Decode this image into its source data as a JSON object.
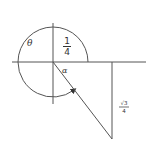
{
  "diagram": {
    "type": "angle-rotation-diagram",
    "colors": {
      "stroke": "#555555",
      "text": "#333333",
      "background": "#ffffff"
    },
    "labels": {
      "theta": "θ",
      "alpha": "α",
      "quarter_num": "1",
      "quarter_den": "4",
      "sqrt3_num": "√3",
      "sqrt3_den": "4"
    },
    "geometry": {
      "origin": [
        53,
        62
      ],
      "arc_radius": 35,
      "x_axis": [
        12,
        146
      ],
      "y_axis": [
        23,
        104
      ],
      "terminal_point": [
        112,
        139
      ],
      "foot_point": [
        112,
        62
      ]
    }
  }
}
